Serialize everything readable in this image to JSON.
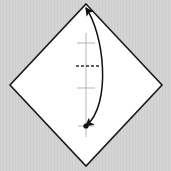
{
  "figure": {
    "canvas": {
      "width": 171,
      "height": 171
    },
    "colors": {
      "background": "#d4d4d4",
      "background_stripe": "#cfcfcf",
      "paper_fill": "#ffffff",
      "paper_edge": "#1a1a1a",
      "guide_line": "#b5b5b5",
      "dashed_crease": "#2b2b2b",
      "arrow": "#111111",
      "dot": "#111111"
    },
    "paper": {
      "shape": "diamond",
      "vertices": [
        {
          "name": "top",
          "x": 86,
          "y": 4
        },
        {
          "name": "right",
          "x": 162,
          "y": 85
        },
        {
          "name": "bottom",
          "x": 86,
          "y": 166
        },
        {
          "name": "left",
          "x": 10,
          "y": 85
        }
      ],
      "edge_width": 1.6
    },
    "vertical_guide": {
      "name": "center-fold-guide",
      "x": 86,
      "y_start": 33,
      "y_end": 137,
      "width": 1
    },
    "ticks": [
      {
        "name": "tick-upper",
        "x": 86,
        "y": 43,
        "half_length": 9
      },
      {
        "name": "tick-lower",
        "x": 86,
        "y": 88,
        "half_length": 9
      },
      {
        "name": "tick-dot",
        "x": 86,
        "y": 126,
        "half_length": 8
      }
    ],
    "dashed_crease": {
      "name": "horizontal-dashed-crease",
      "y": 66,
      "x_start": 76,
      "x_end": 99,
      "dash_pattern": "3 2",
      "width": 1.4
    },
    "marker_dot": {
      "name": "reference-point",
      "x": 86,
      "y": 126,
      "radius": 2.6
    },
    "arrow": {
      "name": "fold-arrow",
      "type": "double-headed-curve",
      "start": {
        "x": 86,
        "y": 126
      },
      "end": {
        "x": 86,
        "y": 8
      },
      "control1": {
        "x": 112,
        "y": 104
      },
      "control2": {
        "x": 104,
        "y": 34
      },
      "stroke_width": 1.5,
      "head_size": 7,
      "heads": [
        "start",
        "end"
      ]
    }
  }
}
